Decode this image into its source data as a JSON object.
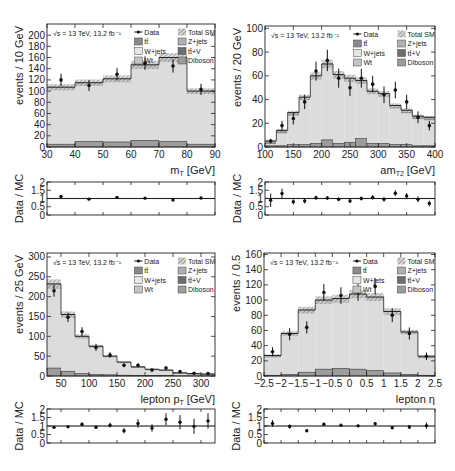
{
  "figure": {
    "energy_label": "√s = 13 TeV, 13.2 fb⁻¹",
    "legend": [
      {
        "key": "data",
        "label": "Data",
        "style": "marker"
      },
      {
        "key": "total_sm",
        "label": "Total SM",
        "style": "hatch"
      },
      {
        "key": "ttbar",
        "label": "tt̄",
        "color": "#8a8a8a"
      },
      {
        "key": "zjets",
        "label": "Z+jets",
        "color": "#b0b0b0"
      },
      {
        "key": "wjets",
        "label": "W+jets",
        "color": "#e6e6e6"
      },
      {
        "key": "ttv",
        "label": "tt̄+V",
        "color": "#6e6e6e"
      },
      {
        "key": "wt",
        "label": "Wt",
        "color": "#c4c4c4"
      },
      {
        "key": "diboson",
        "label": "Diboson",
        "color": "#9c9c9c"
      }
    ],
    "colors": {
      "wjets_fill": "#dcdcdc",
      "ttbar_fill": "#8c8c8c",
      "hatch": "#9a9a9a",
      "frame": "#222222",
      "marker": "#111111"
    }
  },
  "chart_data": [
    {
      "id": "mt",
      "type": "bar",
      "title": "",
      "xlabel": "m_T [GeV]",
      "xlabel_main": "m",
      "xlabel_sub": "T",
      "xlabel_unit": " [GeV]",
      "ylabel": "events / 10 GeV",
      "ratio_ylabel": "Data / MC",
      "xlim": [
        30,
        90
      ],
      "ylim": [
        0,
        220
      ],
      "xticks": [
        30,
        40,
        50,
        60,
        70,
        80,
        90
      ],
      "yticks": [
        0,
        20,
        40,
        60,
        80,
        100,
        120,
        140,
        160,
        180,
        200
      ],
      "bin_edges": [
        30,
        40,
        50,
        60,
        70,
        80,
        90
      ],
      "total_sm": [
        107,
        115,
        122,
        147,
        160,
        100
      ],
      "other_bkg": [
        5,
        10,
        9,
        12,
        10,
        5
      ],
      "data": [
        120,
        110,
        130,
        150,
        145,
        103
      ],
      "data_err": [
        11,
        10,
        11,
        12,
        12,
        10
      ],
      "ratio": [
        1.12,
        0.96,
        1.07,
        1.02,
        0.91,
        1.03
      ],
      "ratio_err": [
        0.05,
        0.04,
        0.04,
        0.04,
        0.04,
        0.05
      ],
      "ratio_ylim": [
        0,
        2
      ],
      "ratio_yticks": [
        "0",
        "0.5",
        "1",
        "1.5",
        "2"
      ]
    },
    {
      "id": "amt2",
      "type": "bar",
      "title": "",
      "xlabel": "am_T2 [GeV]",
      "xlabel_main": "am",
      "xlabel_sub": "T2",
      "xlabel_unit": " [GeV]",
      "ylabel": "events / 20 GeV",
      "ratio_ylabel": "Data / MC",
      "xlim": [
        100,
        400
      ],
      "ylim": [
        0,
        102
      ],
      "xticks": [
        100,
        150,
        200,
        250,
        300,
        350,
        400
      ],
      "yticks": [
        0,
        20,
        40,
        60,
        80,
        100
      ],
      "bin_edges": [
        100,
        120,
        140,
        160,
        180,
        200,
        220,
        240,
        260,
        280,
        300,
        320,
        340,
        360,
        380,
        400
      ],
      "total_sm": [
        5,
        14,
        29,
        42,
        60,
        70,
        61,
        58,
        56,
        47,
        45,
        35,
        31,
        26,
        25
      ],
      "other_bkg": [
        1,
        1,
        2,
        2,
        3,
        6,
        3,
        4,
        7,
        3,
        3,
        2,
        2,
        1,
        1
      ],
      "data": [
        5,
        18,
        24,
        38,
        64,
        73,
        58,
        50,
        58,
        53,
        44,
        48,
        38,
        25,
        18
      ],
      "data_err": [
        2,
        4,
        5,
        6,
        8,
        9,
        8,
        7,
        8,
        7,
        7,
        7,
        6,
        5,
        4
      ],
      "ratio": [
        0.9,
        1.3,
        0.8,
        0.85,
        1.05,
        1.03,
        0.95,
        0.85,
        1.0,
        1.07,
        0.95,
        1.32,
        1.15,
        0.95,
        0.7
      ],
      "ratio_err": [
        0.4,
        0.3,
        0.15,
        0.15,
        0.12,
        0.1,
        0.12,
        0.12,
        0.12,
        0.14,
        0.14,
        0.18,
        0.18,
        0.18,
        0.17
      ],
      "ratio_ylim": [
        0,
        2
      ],
      "ratio_yticks": [
        "0",
        "0.5",
        "1",
        "1.5",
        "2"
      ]
    },
    {
      "id": "lep_pt",
      "type": "bar",
      "title": "",
      "xlabel": "lepton p_T [GeV]",
      "xlabel_main": "lepton p",
      "xlabel_sub": "T",
      "xlabel_unit": " [GeV]",
      "ylabel": "events / 25 GeV",
      "ratio_ylabel": "Data / MC",
      "xlim": [
        25,
        325
      ],
      "ylim": [
        0,
        310
      ],
      "xticks": [
        50,
        100,
        150,
        200,
        250,
        300
      ],
      "yticks": [
        0,
        50,
        100,
        150,
        200,
        250,
        300
      ],
      "bin_edges": [
        25,
        50,
        75,
        100,
        125,
        150,
        175,
        200,
        225,
        250,
        275,
        300,
        325
      ],
      "total_sm": [
        232,
        155,
        100,
        75,
        50,
        35,
        23,
        17,
        15,
        8,
        6,
        5
      ],
      "other_bkg": [
        20,
        12,
        6,
        4,
        3,
        2,
        1,
        1,
        1,
        0.5,
        0.5,
        0.5
      ],
      "data": [
        215,
        148,
        112,
        72,
        53,
        27,
        27,
        15,
        20,
        11,
        7,
        6
      ],
      "data_err": [
        15,
        12,
        11,
        9,
        7,
        5,
        5,
        4,
        4,
        3,
        3,
        2
      ],
      "ratio": [
        0.92,
        0.95,
        1.1,
        0.93,
        1.05,
        0.72,
        1.15,
        0.88,
        1.4,
        1.22,
        0.98,
        1.3
      ],
      "ratio_err": [
        0.06,
        0.07,
        0.1,
        0.1,
        0.14,
        0.15,
        0.25,
        0.22,
        0.35,
        0.42,
        0.45,
        0.45
      ],
      "ratio_ylim": [
        0,
        2
      ],
      "ratio_yticks": [
        "0",
        "0.5",
        "1",
        "1.5",
        "2"
      ]
    },
    {
      "id": "lep_eta",
      "type": "bar",
      "title": "",
      "xlabel": "lepton η",
      "xlabel_main": "lepton η",
      "xlabel_sub": "",
      "xlabel_unit": "",
      "ylabel": "events / 0.5",
      "ratio_ylabel": "Data / MC",
      "xlim": [
        -2.5,
        2.5
      ],
      "ylim": [
        0,
        162
      ],
      "xticks": [
        -2.5,
        -2,
        -1.5,
        -1,
        -0.5,
        0,
        0.5,
        1,
        1.5,
        2,
        2.5
      ],
      "yticks": [
        0,
        20,
        40,
        60,
        80,
        100,
        120,
        140,
        160
      ],
      "bin_edges": [
        -2.5,
        -2,
        -1.5,
        -1,
        -0.5,
        0,
        0.5,
        1,
        1.5,
        2,
        2.5
      ],
      "total_sm": [
        27,
        56,
        87,
        100,
        102,
        108,
        104,
        85,
        58,
        26
      ],
      "other_bkg": [
        1,
        2,
        5,
        9,
        10,
        9,
        7,
        4,
        2,
        1
      ],
      "data": [
        32,
        55,
        64,
        110,
        106,
        110,
        118,
        80,
        56,
        26
      ],
      "data_err": [
        6,
        8,
        8,
        11,
        11,
        11,
        11,
        9,
        8,
        5
      ],
      "ratio": [
        1.15,
        0.97,
        0.72,
        1.1,
        1.04,
        1.01,
        1.13,
        0.9,
        0.94,
        1.02
      ],
      "ratio_err": [
        0.2,
        0.12,
        0.08,
        0.09,
        0.08,
        0.08,
        0.1,
        0.08,
        0.12,
        0.19
      ],
      "ratio_ylim": [
        0,
        2
      ],
      "ratio_yticks": [
        "0",
        "0.5",
        "1",
        "1.5",
        "2"
      ]
    }
  ],
  "layout": {
    "panels": [
      {
        "main": {
          "x": 47,
          "y": 24,
          "w": 168,
          "h": 123
        },
        "ratio": {
          "x": 47,
          "y": 182,
          "w": 168,
          "h": 33
        }
      },
      {
        "main": {
          "x": 265,
          "y": 26,
          "w": 170,
          "h": 121
        },
        "ratio": {
          "x": 265,
          "y": 182,
          "w": 170,
          "h": 33
        }
      },
      {
        "main": {
          "x": 47,
          "y": 253,
          "w": 168,
          "h": 123
        },
        "ratio": {
          "x": 47,
          "y": 409,
          "w": 168,
          "h": 34
        }
      },
      {
        "main": {
          "x": 264,
          "y": 253,
          "w": 171,
          "h": 123
        },
        "ratio": {
          "x": 264,
          "y": 409,
          "w": 171,
          "h": 34
        }
      }
    ]
  }
}
